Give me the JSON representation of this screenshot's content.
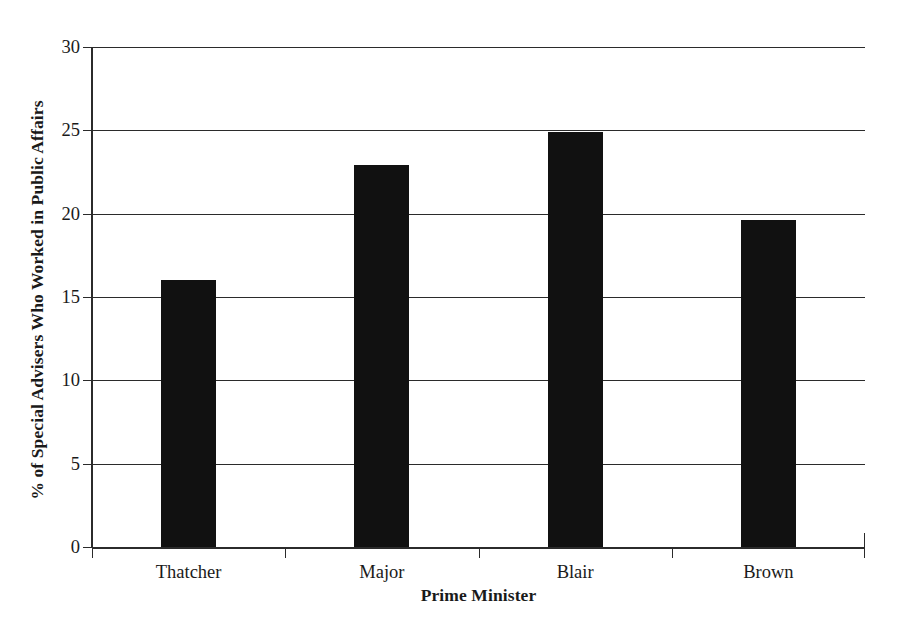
{
  "chart_data": {
    "type": "bar",
    "title": "",
    "categories": [
      "Thatcher",
      "Major",
      "Blair",
      "Brown"
    ],
    "values": [
      16.0,
      22.9,
      24.9,
      19.6
    ],
    "xlabel": "Prime Minister",
    "ylabel": "% of Special Advisers Who Worked in Public Affairs",
    "ylim": [
      0,
      30
    ],
    "ytick_values": [
      0,
      5,
      10,
      15,
      20,
      25,
      30
    ],
    "ytick_labels": [
      "0",
      "5",
      "10",
      "15",
      "20",
      "25",
      "30"
    ],
    "grid": true,
    "grid_axis": "y",
    "legend": "none",
    "bar_color": "#111111",
    "axis_color": "#2b2b2b",
    "background_color": "#ffffff"
  }
}
